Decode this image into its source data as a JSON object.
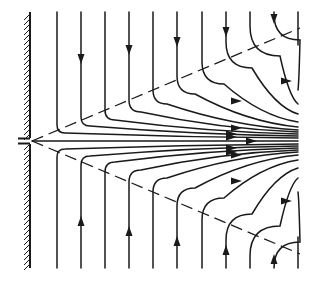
{
  "figure": {
    "title": "",
    "width": 312,
    "height": 282,
    "colors": {
      "ink": "#1a1a1a",
      "background": "#ffffff"
    }
  },
  "wall": {
    "x": 30,
    "y_top": 12,
    "y_bottom": 268,
    "hatch_side": "left"
  },
  "slot": {
    "x": 18,
    "y": 141,
    "length": 14
  },
  "centerline": {
    "y": 141,
    "x_start": 32,
    "x_end": 298,
    "arrow_x": 255
  },
  "dashed_lines": [
    {
      "name": "upper-separatrix",
      "x1": 32,
      "y1": 141,
      "x2": 300,
      "y2": 28
    },
    {
      "name": "lower-separatrix",
      "x1": 32,
      "y1": 141,
      "x2": 300,
      "y2": 254
    }
  ],
  "streamlines_top": [
    {
      "x": 57,
      "turn_y": 133,
      "end_y": 138,
      "radius": 8,
      "arrow": null
    },
    {
      "x": 81,
      "turn_y": 126,
      "end_y": 136,
      "radius": 9,
      "arrow": {
        "dir": "down",
        "at": 62
      }
    },
    {
      "x": 105,
      "turn_y": 120,
      "end_y": 134,
      "radius": 10,
      "arrow": null
    },
    {
      "x": 129,
      "turn_y": 112,
      "end_y": 132,
      "radius": 12,
      "arrow": {
        "dir": "down",
        "at": 53
      }
    },
    {
      "x": 153,
      "turn_y": 104,
      "end_y": 130,
      "radius": 14,
      "arrow": null
    },
    {
      "x": 177,
      "turn_y": 94,
      "end_y": 127,
      "radius": 18,
      "arrow": {
        "dir": "down",
        "at": 45
      }
    },
    {
      "x": 202,
      "turn_y": 84,
      "end_y": 122,
      "radius": 22,
      "arrow": null
    },
    {
      "x": 226,
      "turn_y": 68,
      "end_y": 114,
      "radius": 26,
      "arrow": {
        "dir": "down",
        "at": 35
      }
    },
    {
      "x": 250,
      "turn_y": 56,
      "end_y": 104,
      "radius": 30,
      "arrow": null
    },
    {
      "x": 274,
      "turn_y": 40,
      "end_y": 90,
      "radius": 26,
      "arrow": {
        "dir": "down",
        "at": 22
      }
    },
    {
      "x": 298,
      "turn_y": 20,
      "end_y": 45,
      "radius": 10,
      "arrow": null
    }
  ],
  "streamlines_bottom": [
    {
      "x": 57,
      "turn_y": 149,
      "end_y": 144,
      "radius": 8,
      "arrow": null
    },
    {
      "x": 81,
      "turn_y": 156,
      "end_y": 146,
      "radius": 9,
      "arrow": {
        "dir": "up",
        "at": 218
      }
    },
    {
      "x": 105,
      "turn_y": 162,
      "end_y": 148,
      "radius": 10,
      "arrow": null
    },
    {
      "x": 129,
      "turn_y": 170,
      "end_y": 150,
      "radius": 12,
      "arrow": {
        "dir": "up",
        "at": 228
      }
    },
    {
      "x": 153,
      "turn_y": 178,
      "end_y": 152,
      "radius": 14,
      "arrow": null
    },
    {
      "x": 177,
      "turn_y": 188,
      "end_y": 155,
      "radius": 18,
      "arrow": {
        "dir": "up",
        "at": 238
      }
    },
    {
      "x": 202,
      "turn_y": 198,
      "end_y": 160,
      "radius": 22,
      "arrow": null
    },
    {
      "x": 226,
      "turn_y": 214,
      "end_y": 168,
      "radius": 26,
      "arrow": {
        "dir": "up",
        "at": 247
      }
    },
    {
      "x": 250,
      "turn_y": 226,
      "end_y": 178,
      "radius": 30,
      "arrow": null
    },
    {
      "x": 274,
      "turn_y": 242,
      "end_y": 192,
      "radius": 26,
      "arrow": {
        "dir": "up",
        "at": 256
      }
    },
    {
      "x": 298,
      "turn_y": 262,
      "end_y": 237,
      "radius": 10,
      "arrow": null
    }
  ],
  "horizontal_arrows": [
    {
      "x": 240,
      "y": 128
    },
    {
      "x": 235,
      "y": 134
    },
    {
      "x": 235,
      "y": 137
    },
    {
      "x": 290,
      "y": 81
    },
    {
      "x": 240,
      "y": 101
    },
    {
      "x": 235,
      "y": 148
    },
    {
      "x": 235,
      "y": 152
    },
    {
      "x": 240,
      "y": 155
    },
    {
      "x": 290,
      "y": 201
    },
    {
      "x": 240,
      "y": 181
    }
  ],
  "y_top": 12,
  "y_bottom": 268,
  "x_right": 298
}
